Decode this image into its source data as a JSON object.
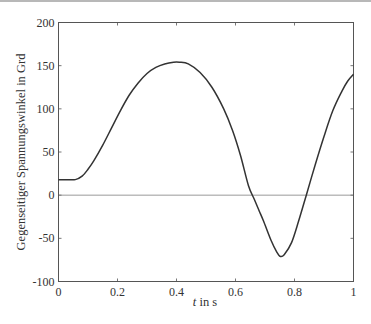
{
  "chart_data": {
    "type": "line",
    "title": "",
    "xlabel_italic": "t",
    "xlabel_rest": " in s",
    "xlabel": "t in s",
    "ylabel": "Gegenseitiger Spannungswinkel in Grd",
    "xlim": [
      0,
      1
    ],
    "ylim": [
      -100,
      200
    ],
    "grid": false,
    "legend": null,
    "xticks": [
      0,
      0.2,
      0.4,
      0.6,
      0.8,
      1
    ],
    "xtick_labels": [
      "0",
      "0.2",
      "0.4",
      "0.6",
      "0.8",
      "1"
    ],
    "yticks": [
      200,
      150,
      100,
      50,
      0,
      -50,
      -100
    ],
    "ytick_labels": [
      "200",
      "150",
      "100",
      "50",
      "0",
      "-50",
      "-100"
    ],
    "reference_line": {
      "y": 0,
      "color": "#999999"
    },
    "series": [
      {
        "name": "Spannungswinkel",
        "color": "#333333",
        "x": [
          0,
          0.03,
          0.057,
          0.08,
          0.1,
          0.12,
          0.15,
          0.18,
          0.21,
          0.24,
          0.27,
          0.3,
          0.33,
          0.36,
          0.39,
          0.41,
          0.44,
          0.48,
          0.52,
          0.56,
          0.59,
          0.617,
          0.644,
          0.664,
          0.68,
          0.695,
          0.72,
          0.74,
          0.752,
          0.765,
          0.79,
          0.814,
          0.84,
          0.87,
          0.9,
          0.93,
          0.96,
          0.98,
          1.0
        ],
        "y": [
          18,
          18,
          18,
          22,
          30,
          40,
          58,
          78,
          98,
          116,
          130,
          141,
          148,
          152,
          154,
          154,
          152,
          142,
          125,
          100,
          75,
          46,
          11,
          -5,
          -18,
          -30,
          -52,
          -66,
          -71,
          -69,
          -55,
          -30,
          0,
          35,
          68,
          98,
          120,
          132,
          140
        ]
      }
    ]
  }
}
